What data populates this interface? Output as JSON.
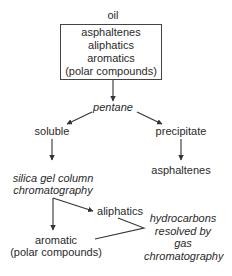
{
  "diagram": {
    "top_label": "oil",
    "oil_box": {
      "lines": [
        "asphaltenes",
        "aliphatics",
        "aromatics",
        "(polar compounds)"
      ]
    },
    "solvent": "pentane",
    "left_branch": {
      "label": "soluble",
      "process": [
        "silica gel column",
        "chromatography"
      ],
      "fraction_a": "aliphatics",
      "fraction_b": [
        "aromatic",
        "(polar compounds)"
      ]
    },
    "right_branch": {
      "label": "precipitate",
      "product": "asphaltenes"
    },
    "analysis": [
      "hydrocarbons",
      "resolved by",
      "gas",
      "chromatography"
    ],
    "line_color": "#333333"
  }
}
